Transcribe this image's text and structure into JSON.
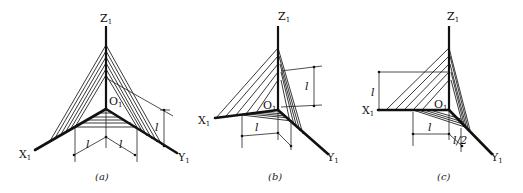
{
  "figure": {
    "panels": [
      {
        "id": "a",
        "caption": "(a)",
        "labels": {
          "z": "Z",
          "x": "X",
          "y": "Y",
          "o": "O",
          "sub": "1",
          "dim_x": "l",
          "dim_y": "l",
          "dim_z": "l"
        }
      },
      {
        "id": "b",
        "caption": "(b)",
        "labels": {
          "z": "Z",
          "x": "X",
          "y": "Y",
          "o": "O",
          "sub": "1",
          "dim_x": "l",
          "dim_z": "l"
        }
      },
      {
        "id": "c",
        "caption": "(c)",
        "labels": {
          "z": "Z",
          "x": "X",
          "y": "Y",
          "o": "O",
          "sub": "1",
          "dim_x": "l",
          "dim_z": "l",
          "dim_y": "l/2"
        }
      }
    ]
  }
}
